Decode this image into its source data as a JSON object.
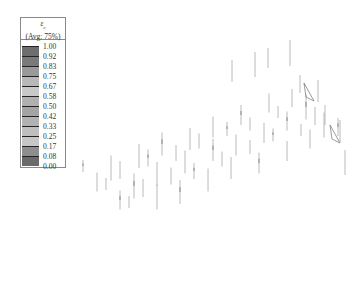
{
  "legend": {
    "variable": "ε",
    "subscript": "c",
    "averaging": "(Avg: 75%)",
    "entries": [
      {
        "value": "1.00",
        "color": "#6e6e6e"
      },
      {
        "value": "0.92",
        "color": "#7a7a7a"
      },
      {
        "value": "0.83",
        "color": "#9a9a9a"
      },
      {
        "value": "0.75",
        "color": "#b8b8b8"
      },
      {
        "value": "0.67",
        "color": "#c8c8c8"
      },
      {
        "value": "0.58",
        "color": "#b0b0b0"
      },
      {
        "value": "0.50",
        "color": "#a4a4a4"
      },
      {
        "value": "0.42",
        "color": "#b2b2b2"
      },
      {
        "value": "0.33",
        "color": "#bfbfbf"
      },
      {
        "value": "0.25",
        "color": "#c6c6c6"
      },
      {
        "value": "0.17",
        "color": "#8e8e8e"
      },
      {
        "value": "0.08",
        "color": "#6a6a6a"
      },
      {
        "value": "0.00",
        "color": ""
      }
    ]
  },
  "plot": {
    "description": "3D slab model, faint vertical element/rebar lines",
    "line_color": "#a8a8a8",
    "edge_color": "#707070"
  }
}
